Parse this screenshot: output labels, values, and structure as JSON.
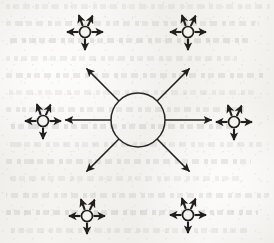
{
  "document": {
    "kind": "scanned-book-page-figure",
    "figure_type": "radial hub-and-spoke expansion diagram",
    "caption": "",
    "background_color": "#f2f1ee",
    "ink_color": "#231f1d",
    "page_artifacts": {
      "show_through_text": true,
      "show_through_line_count": 14,
      "speckle_noise": true
    }
  },
  "diagram": {
    "name": "central-node-with-six-expanding-branches",
    "hub": {
      "label": "",
      "center": {
        "x": 138,
        "y": 120
      },
      "radius": 27,
      "stroke_width": 1.5
    },
    "spokes": [
      {
        "name": "spoke-west",
        "angle_deg": 180,
        "start_r": 27,
        "end_r": 73,
        "head": "arrow"
      },
      {
        "name": "spoke-east",
        "angle_deg": 0,
        "start_r": 27,
        "end_r": 74,
        "head": "arrow"
      },
      {
        "name": "spoke-northwest",
        "angle_deg": 225,
        "start_r": 27,
        "end_r": 73,
        "head": "arrow"
      },
      {
        "name": "spoke-northeast",
        "angle_deg": 315,
        "start_r": 27,
        "end_r": 73,
        "head": "arrow"
      },
      {
        "name": "spoke-southwest",
        "angle_deg": 135,
        "start_r": 27,
        "end_r": 73,
        "head": "arrow"
      },
      {
        "name": "spoke-southeast",
        "angle_deg": 45,
        "start_r": 27,
        "end_r": 73,
        "head": "arrow"
      }
    ],
    "satellites": [
      {
        "name": "satellite-top-left",
        "label": "",
        "center": {
          "x": 85,
          "y": 32
        },
        "radius": 5.5,
        "ray_count": 5
      },
      {
        "name": "satellite-top-right",
        "label": "",
        "center": {
          "x": 188,
          "y": 32
        },
        "radius": 5.5,
        "ray_count": 5
      },
      {
        "name": "satellite-left",
        "label": "",
        "center": {
          "x": 43,
          "y": 121
        },
        "radius": 5.5,
        "ray_count": 5
      },
      {
        "name": "satellite-right",
        "label": "",
        "center": {
          "x": 234,
          "y": 122
        },
        "radius": 5.5,
        "ray_count": 5
      },
      {
        "name": "satellite-bottom-left",
        "label": "",
        "center": {
          "x": 87,
          "y": 216
        },
        "radius": 5.5,
        "ray_count": 5
      },
      {
        "name": "satellite-bottom-right",
        "label": "",
        "center": {
          "x": 188,
          "y": 215
        },
        "radius": 5.5,
        "ray_count": 5
      }
    ],
    "satellite_ray_angles_deg": [
      250,
      295,
      180,
      0,
      90
    ]
  },
  "chart_data": {
    "type": "diagram",
    "title": "",
    "node_count": 7,
    "edge_count": 6,
    "nodes": [
      {
        "id": "hub",
        "role": "center",
        "outgoing_edges": 6
      },
      {
        "id": "satellite-top-left",
        "role": "leaf-cluster",
        "outgoing_edges": 5
      },
      {
        "id": "satellite-top-right",
        "role": "leaf-cluster",
        "outgoing_edges": 5
      },
      {
        "id": "satellite-left",
        "role": "leaf-cluster",
        "outgoing_edges": 5
      },
      {
        "id": "satellite-right",
        "role": "leaf-cluster",
        "outgoing_edges": 5
      },
      {
        "id": "satellite-bottom-left",
        "role": "leaf-cluster",
        "outgoing_edges": 5
      },
      {
        "id": "satellite-bottom-right",
        "role": "leaf-cluster",
        "outgoing_edges": 5
      }
    ],
    "edges": [
      {
        "from": "hub",
        "to": "satellite-top-left",
        "directed": true
      },
      {
        "from": "hub",
        "to": "satellite-top-right",
        "directed": true
      },
      {
        "from": "hub",
        "to": "satellite-left",
        "directed": true
      },
      {
        "from": "hub",
        "to": "satellite-right",
        "directed": true
      },
      {
        "from": "hub",
        "to": "satellite-bottom-left",
        "directed": true
      },
      {
        "from": "hub",
        "to": "satellite-bottom-right",
        "directed": true
      }
    ]
  }
}
